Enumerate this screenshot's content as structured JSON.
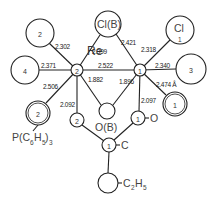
{
  "diagram": {
    "type": "molecular-structure",
    "metal_label": "Re",
    "atoms": {
      "re2": {
        "index": "2"
      },
      "re1": {
        "index": "1"
      },
      "ligand_top_left": {
        "index": "2"
      },
      "ligand_left": {
        "index": "4"
      },
      "phosphine": {
        "index": "2",
        "label": "P(C",
        "sub1": "6",
        "mid": "H",
        "sub2": "5",
        "close": ")",
        "sub3": "3"
      },
      "cl_bridge": {
        "label": "Cl(B)"
      },
      "cl_terminal": {
        "label": "Cl",
        "index": "1"
      },
      "ligand_right": {
        "index": "3"
      },
      "ligand_lower_right": {
        "index": "1"
      },
      "o_bridge": {
        "label": "O(B)"
      },
      "o_small_left": {
        "index": "2"
      },
      "o_small_right": {
        "index": "1",
        "label": "O"
      },
      "carbon": {
        "index": "1",
        "label": "C"
      },
      "ethyl": {
        "label": "C",
        "sub": "2",
        "mid": "H",
        "sub2": "5"
      }
    },
    "bond_lengths": {
      "re2_top_left": "2.302",
      "re2_left": "2.371",
      "re2_lower_left": "2.506",
      "re2_clb": "2.399",
      "re_re": "2.522",
      "re2_ob": "1.882",
      "re1_ob": "1.896",
      "re1_clb": "2.421",
      "re1_cl1": "2.318",
      "re1_right": "2.340",
      "re1_lower_right": "2.474 Å",
      "re2_o2": "2.092",
      "re1_o1": "2.097"
    }
  }
}
